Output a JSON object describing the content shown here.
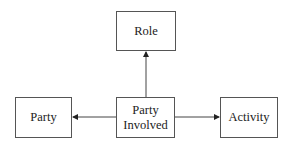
{
  "diagram": {
    "nodes": [
      {
        "id": "role",
        "label": "Role"
      },
      {
        "id": "party",
        "label": "Party"
      },
      {
        "id": "party_involved",
        "label": "Party\nInvolved",
        "lines": [
          "Party",
          "Involved"
        ]
      },
      {
        "id": "activity",
        "label": "Activity"
      }
    ],
    "edges": [
      {
        "from": "party_involved",
        "to": "role",
        "arrow": "target"
      },
      {
        "from": "party_involved",
        "to": "party",
        "arrow": "target"
      },
      {
        "from": "party_involved",
        "to": "activity",
        "arrow": "target"
      }
    ]
  }
}
